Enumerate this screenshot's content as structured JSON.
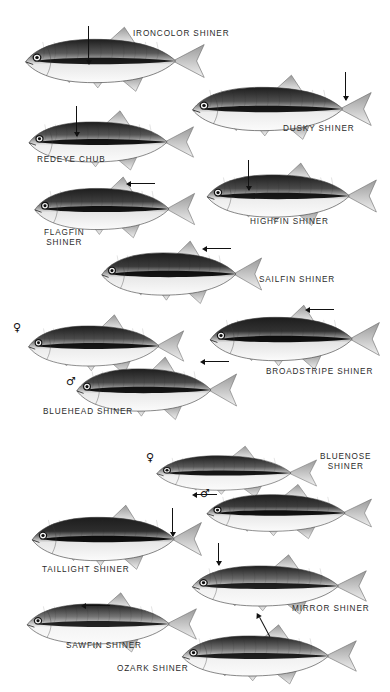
{
  "plate": {
    "title": "Shiner Minnows Identification Plate",
    "background_color": "#ffffff",
    "ink_color": "#2b2b2b",
    "width": 390,
    "height": 692
  },
  "symbols": {
    "female": "♀",
    "male": "♂"
  },
  "specimens": [
    {
      "id": "ironcolor-shiner",
      "label": "IRONCOLOR SHINER",
      "label_x": 133,
      "label_y": 29,
      "align": "left",
      "fish_x": 18,
      "fish_y": 22,
      "fish_w": 190,
      "fish_h": 78,
      "body_fill": "#595959",
      "belly_fill": "#e8e8e8",
      "stripe_fill": "#101010",
      "pointer": {
        "type": "vertical",
        "x": 88,
        "y": 26,
        "length": 38
      },
      "sex": null
    },
    {
      "id": "dusky-shiner",
      "label": "DUSKY SHINER",
      "label_x": 283,
      "label_y": 124,
      "align": "left",
      "fish_x": 185,
      "fish_y": 70,
      "fish_w": 190,
      "fish_h": 78,
      "body_fill": "#4f4f4f",
      "belly_fill": "#ececec",
      "stripe_fill": "#0c0c0c",
      "pointer": {
        "type": "vertical",
        "x": 345,
        "y": 72,
        "length": 28
      },
      "sex": null
    },
    {
      "id": "redeye-chub",
      "label": "REDEYE CHUB",
      "label_x": 37,
      "label_y": 155,
      "align": "left",
      "fish_x": 22,
      "fish_y": 106,
      "fish_w": 175,
      "fish_h": 72,
      "body_fill": "#555555",
      "belly_fill": "#ededed",
      "stripe_fill": "#0a0a0a",
      "pointer": {
        "type": "vertical",
        "x": 76,
        "y": 106,
        "length": 30
      },
      "sex": null
    },
    {
      "id": "highfin-shiner",
      "label": "HIGHFIN SHINER",
      "label_x": 250,
      "label_y": 217,
      "align": "left",
      "fish_x": 200,
      "fish_y": 158,
      "fish_w": 180,
      "fish_h": 76,
      "body_fill": "#4a4a4a",
      "belly_fill": "#ededed",
      "stripe_fill": "#0d0d0d",
      "pointer": {
        "type": "vertical",
        "x": 248,
        "y": 160,
        "length": 30
      },
      "sex": null
    },
    {
      "id": "flagfin-shiner",
      "label": "FLAGFIN\nSHINER",
      "label_x": 44,
      "label_y": 228,
      "align": "center",
      "fish_x": 28,
      "fish_y": 172,
      "fish_w": 170,
      "fish_h": 74,
      "body_fill": "#3f3f3f",
      "belly_fill": "#e6e6e6",
      "stripe_fill": "#080808",
      "pointer": {
        "type": "arrow-left",
        "x": 131,
        "y": 183,
        "length": 24
      },
      "sex": null
    },
    {
      "id": "sailfin-shiner",
      "label": "SAILFIN SHINER",
      "label_x": 259,
      "label_y": 275,
      "align": "left",
      "fish_x": 95,
      "fish_y": 236,
      "fish_w": 170,
      "fish_h": 76,
      "body_fill": "#3b3b3b",
      "belly_fill": "#e8e8e8",
      "stripe_fill": "#070707",
      "pointer": {
        "type": "arrow-left",
        "x": 207,
        "y": 248,
        "length": 24
      },
      "sex": null
    },
    {
      "id": "broadstripe-shiner",
      "label": "BROADSTRIPE SHINER",
      "label_x": 266,
      "label_y": 367,
      "align": "left",
      "fish_x": 203,
      "fish_y": 300,
      "fish_w": 180,
      "fish_h": 78,
      "body_fill": "#323232",
      "belly_fill": "#e4e4e4",
      "stripe_fill": "#050505",
      "pointer": {
        "type": "arrow-left",
        "x": 310,
        "y": 309,
        "length": 24
      },
      "sex": null
    },
    {
      "id": "bluehead-shiner-female",
      "label": "",
      "label_x": 0,
      "label_y": 0,
      "align": "left",
      "fish_x": 22,
      "fish_y": 310,
      "fish_w": 165,
      "fish_h": 72,
      "body_fill": "#4c4c4c",
      "belly_fill": "#ececec",
      "stripe_fill": "#0a0a0a",
      "pointer": null,
      "sex": "female",
      "sex_x": 13,
      "sex_y": 322
    },
    {
      "id": "bluehead-shiner-male",
      "label": "BLUEHEAD SHINER",
      "label_x": 43,
      "label_y": 407,
      "align": "left",
      "fish_x": 70,
      "fish_y": 352,
      "fish_w": 170,
      "fish_h": 76,
      "body_fill": "#484848",
      "belly_fill": "#e9e9e9",
      "stripe_fill": "#090909",
      "pointer": {
        "type": "arrow-left",
        "x": 205,
        "y": 361,
        "length": 24
      },
      "sex": "male",
      "sex_x": 66,
      "sex_y": 376
    },
    {
      "id": "bluenose-shiner-female",
      "label": "BLUENOSE\nSHINER",
      "label_x": 320,
      "label_y": 452,
      "align": "center",
      "fish_x": 150,
      "fish_y": 442,
      "fish_w": 170,
      "fish_h": 62,
      "body_fill": "#5a5a5a",
      "belly_fill": "#efefef",
      "stripe_fill": "#0b0b0b",
      "pointer": null,
      "sex": "female",
      "sex_x": 146,
      "sex_y": 452
    },
    {
      "id": "bluenose-shiner-male",
      "label": "",
      "label_x": 0,
      "label_y": 0,
      "align": "left",
      "fish_x": 200,
      "fish_y": 480,
      "fish_w": 175,
      "fish_h": 66,
      "body_fill": "#3d3d3d",
      "belly_fill": "#e9e9e9",
      "stripe_fill": "#060606",
      "pointer": {
        "type": "arrow-left",
        "x": 197,
        "y": 494,
        "length": 20
      },
      "sex": "male",
      "sex_x": 200,
      "sex_y": 488
    },
    {
      "id": "taillight-shiner",
      "label": "TAILLIGHT SHINER",
      "label_x": 42,
      "label_y": 565,
      "align": "left",
      "fish_x": 25,
      "fish_y": 500,
      "fish_w": 180,
      "fish_h": 78,
      "body_fill": "#2e2e2e",
      "belly_fill": "#e7e7e7",
      "stripe_fill": "#040404",
      "pointer": {
        "type": "vertical",
        "x": 172,
        "y": 508,
        "length": 28
      },
      "sex": null
    },
    {
      "id": "mirror-shiner",
      "label": "MIRROR SHINER",
      "label_x": 292,
      "label_y": 604,
      "align": "left",
      "fish_x": 185,
      "fish_y": 550,
      "fish_w": 185,
      "fish_h": 72,
      "body_fill": "#6a6a6a",
      "belly_fill": "#f2f2f2",
      "stripe_fill": "#141414",
      "pointer": {
        "type": "vertical",
        "x": 218,
        "y": 543,
        "length": 22
      },
      "sex": null
    },
    {
      "id": "sawfin-shiner",
      "label": "SAWFIN SHINER",
      "label_x": 66,
      "label_y": 641,
      "align": "left",
      "fish_x": 20,
      "fish_y": 588,
      "fish_w": 180,
      "fish_h": 72,
      "body_fill": "#757575",
      "belly_fill": "#f4f4f4",
      "stripe_fill": "#171717",
      "pointer": {
        "type": "arrow-left",
        "x": 86,
        "y": 605,
        "length": 24
      },
      "sex": null
    },
    {
      "id": "ozark-shiner",
      "label": "OZARK SHINER",
      "label_x": 117,
      "label_y": 664,
      "align": "left",
      "fish_x": 175,
      "fish_y": 620,
      "fish_w": 185,
      "fish_h": 72,
      "body_fill": "#6f6f6f",
      "belly_fill": "#f2f2f2",
      "stripe_fill": "#131313",
      "pointer": {
        "type": "diagonal",
        "x": 260,
        "y": 617,
        "length": 22,
        "angle": 62
      },
      "sex": null
    }
  ]
}
